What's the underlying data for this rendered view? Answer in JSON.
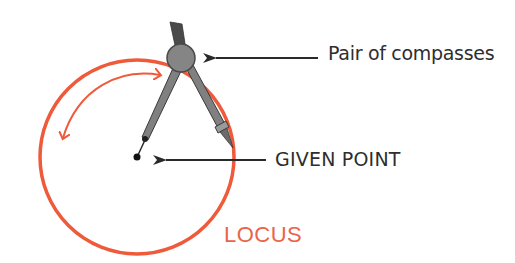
{
  "diagram": {
    "type": "labeled-illustration",
    "labels": {
      "compasses": "Pair of compasses",
      "given_point": "GIVEN POINT",
      "locus": "LOCUS"
    },
    "elements": [
      {
        "id": "locus-circle",
        "kind": "circle",
        "description": "orange circle traced around the given point"
      },
      {
        "id": "compass",
        "kind": "illustration",
        "description": "grey pair of compasses with needle on the given point and pencil on the circle"
      },
      {
        "id": "rotation-arrow",
        "kind": "double-headed curved arrow",
        "description": "orange arc indicating rotation of the compass"
      },
      {
        "id": "given-point",
        "kind": "point",
        "description": "black dot at the centre of the circle"
      },
      {
        "id": "arrow-to-compass",
        "kind": "arrow",
        "from": "Pair of compasses",
        "to": "compass hinge"
      },
      {
        "id": "arrow-to-point",
        "kind": "arrow",
        "from": "GIVEN POINT",
        "to": "given point"
      }
    ],
    "colors": {
      "locus": "#ee5a3a",
      "locus_text": "#e9644a",
      "compass_body": "#7a7a7a",
      "compass_dark": "#4a4a4a",
      "arrows": "#2a2a2a",
      "text": "#2e2e2e",
      "background": "#ffffff"
    }
  }
}
